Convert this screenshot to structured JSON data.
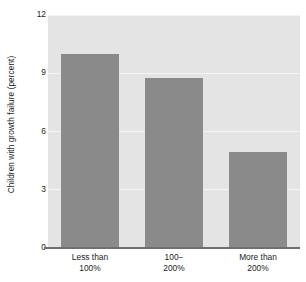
{
  "chart_data": {
    "type": "bar",
    "title": "",
    "xlabel": "",
    "ylabel": "Children with growth failure (percent)",
    "categories": [
      "Less than 100%",
      "100− 200%",
      "More than 200%"
    ],
    "category_lines": [
      [
        "Less than",
        "100%"
      ],
      [
        "100−",
        "200%"
      ],
      [
        "More than",
        "200%"
      ]
    ],
    "values": [
      10.0,
      8.75,
      4.95
    ],
    "ylim": [
      0,
      12
    ],
    "yticks": [
      0,
      3,
      6,
      9,
      12
    ],
    "ytick_labels": [
      "0",
      "3",
      "6",
      "9",
      "12"
    ],
    "grid": true,
    "legend": "none",
    "colors": {
      "bar": "#8a8a8a",
      "plot_background": "#e4e4e4",
      "gridline": "#f4f4f4",
      "axis": "#6f6f6f",
      "text": "#1c1c1c",
      "page_background": "#ffffff"
    }
  }
}
